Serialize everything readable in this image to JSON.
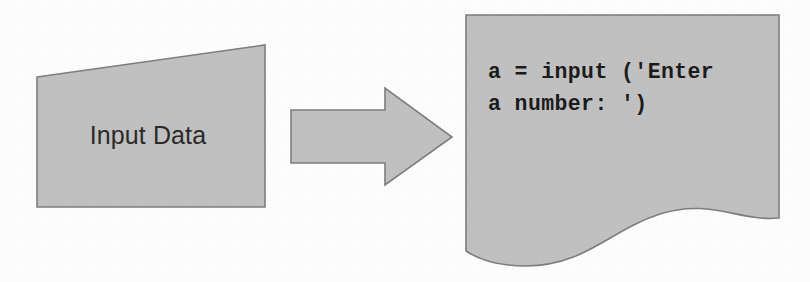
{
  "diagram": {
    "background_color": "#ffffff",
    "shape_fill_color": "#c2c2c2",
    "shape_stroke_color": "#7f7f7f",
    "text_color": "#1c1c1c",
    "input_node": {
      "label": "Input Data",
      "shape": "trapezoid-parallelogram"
    },
    "arrow": {
      "label": "",
      "direction": "right",
      "shape": "block-arrow"
    },
    "output_node": {
      "shape": "document-wavy-bottom",
      "code_lines": [
        "a = input ('Enter",
        "a number: ')"
      ]
    }
  }
}
